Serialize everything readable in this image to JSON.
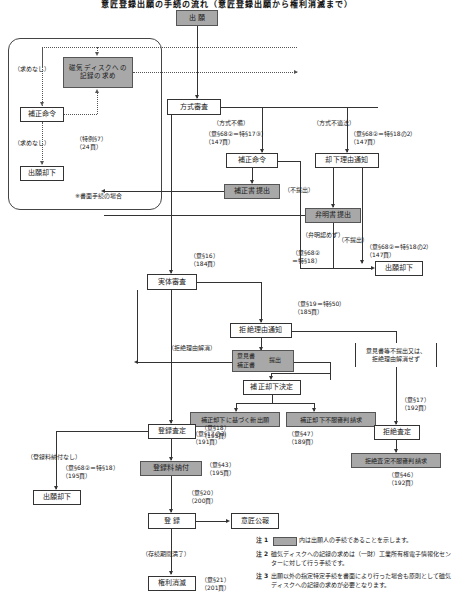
{
  "title": "意匠登録出願の手続の流れ（意匠登録出願から権利消滅まで）",
  "colors": {
    "applicant_fill": "#a8a8a8",
    "office_fill": "#ffffff",
    "line": "#333333"
  },
  "nodes": {
    "shutsugan": "出 願",
    "jiki_disk": "磁気ディスクへの\n記録の求め",
    "hosei_meirei_left": "補正命令",
    "shutsugan_kyakka_left": "出願却下",
    "houshiki_shinsa": "方式審査",
    "hosei_meirei": "補正命令",
    "hoseisho_teishutsu": "補正書提出",
    "kyakka_riyu_tsuchi": "却下理由通知",
    "benmeisho_teishutsu": "弁明書提出",
    "shutsugan_kyakka_mid": "出願却下",
    "jittai_shinsa": "実体審査",
    "kyozetsu_riyu_tsuchi": "拒絶理由通知",
    "ikensho": "意見書",
    "hoseisho": "補正書",
    "teishutsu": "提出",
    "hosei_kyakka_kettei": "補正却下決定",
    "hosei_kyakka_shin_shutsugan": "補正却下に基づく新出願",
    "hosei_kyakka_fufuku_shinpan": "補正却下不服審判請求",
    "kyozetsu_satei": "拒絶査定",
    "kyozetsu_satei_fufuku_shinpan": "拒絶査定不服審判請求",
    "touroku_satei": "登録査定",
    "tourokuryo_nofu": "登録料納付",
    "shutsugan_kyakka_bottom": "出願却下",
    "touroku": "登 録",
    "isho_kouhou": "意匠公報",
    "kenri_shometsu": "権利消滅",
    "iken_fu_teishutsu": "意見書等不提出又は、\n拒絶理由解消せず"
  },
  "labels": {
    "motomenashi_1": "（求めなし）",
    "motomenashi_2": "（求めなし）",
    "tokurei_7": "（特例§7）\n（24頁）",
    "shomen_tetsuzuki": "※書面手続の場合",
    "houshiki_fubi": "（方式不備）",
    "ref_68_2_17_3": "（意§68②＝特§17③）\n（147頁）",
    "houshiki_futekihou": "（方式不適法）",
    "ref_68_2_18_2_a": "（意§68②＝特§18の2）\n（147頁）",
    "futeishutsu_1": "（不提出）",
    "futeishutsu_2": "（不提出）",
    "benmei_mitomezu": "（弁明認めず）",
    "ref_68_2_18": "（意§68②\n＝特§18）",
    "ref_68_2_18_2_b": "（意§68②＝特§18の2）\n（147頁）",
    "ref_16": "（意§16）\n（184頁）",
    "ref_19_50": "（意§19＝特§50）\n（185頁）",
    "kyozetsu_riyu_kaishou": "（拒絶理由解消）",
    "ref_17_no3": "（意§17の3）\n（191頁）",
    "ref_47": "（意§47）\n（189頁）",
    "ref_17": "（意§17）\n（192頁）",
    "ref_46": "（意§46）\n（192頁）",
    "ref_18": "（意§18）\n（195頁）",
    "ref_43": "（意§43）\n（195頁）",
    "tourokuryo_nofu_nashi": "（登録料納付なし）",
    "ref_68_2_18_bottom": "（意§68②＝特§18）\n（195頁）",
    "ref_20": "（意§20）\n（200頁）",
    "sonzoku_kikan_manryo": "（存続期間満了）",
    "ref_21": "（意§21）\n（201頁）"
  },
  "notes": [
    {
      "marker": "注 1",
      "text": "内は出願人の手続であることを示します。",
      "has_swatch": true
    },
    {
      "marker": "注 2",
      "text": "磁気ディスクへの記録の求めは（一財）工業所有権電子情報化センターに対して行う手続です。",
      "has_swatch": false
    },
    {
      "marker": "注 3",
      "text": "出願以外の指定特定手続を書面により行った場合も原則として磁気ディスクへの記録の求めが必要となります。",
      "has_swatch": false
    }
  ]
}
